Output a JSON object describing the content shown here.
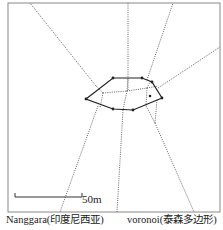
{
  "figure": {
    "frame": {
      "x": 8,
      "y": 3,
      "width": 212,
      "height": 209
    },
    "colors": {
      "frame": "#888888",
      "polygon": "#222222",
      "voronoi": "#555555",
      "background": "#ffffff"
    },
    "hull_polygon": [
      [
        86,
        99
      ],
      [
        113,
        78
      ],
      [
        142,
        78
      ],
      [
        152,
        82
      ],
      [
        162,
        98
      ],
      [
        133,
        110
      ],
      [
        113,
        109
      ]
    ],
    "vertices": [
      [
        86,
        99
      ],
      [
        113,
        78
      ],
      [
        142,
        78
      ],
      [
        152,
        82
      ],
      [
        162,
        98
      ],
      [
        133,
        110
      ],
      [
        113,
        109
      ]
    ],
    "interior_point": [
      150,
      96
    ],
    "voronoi_edges": [
      [
        [
          96,
          86
        ],
        [
          30,
          3
        ]
      ],
      [
        [
          128,
          90
        ],
        [
          128,
          3
        ]
      ],
      [
        [
          147,
          80
        ],
        [
          173,
          3
        ]
      ],
      [
        [
          158,
          88
        ],
        [
          220,
          47
        ]
      ],
      [
        [
          98,
          106
        ],
        [
          60,
          212
        ]
      ],
      [
        [
          123,
          110
        ],
        [
          117,
          212
        ]
      ],
      [
        [
          146,
          106
        ],
        [
          155,
          123
        ]
      ],
      [
        [
          157,
          100
        ],
        [
          155,
          123
        ]
      ],
      [
        [
          155,
          123
        ],
        [
          194,
          212
        ]
      ],
      [
        [
          103,
          93
        ],
        [
          127,
          91
        ]
      ],
      [
        [
          127,
          91
        ],
        [
          128,
          78
        ]
      ],
      [
        [
          127,
          91
        ],
        [
          123,
          110
        ]
      ],
      [
        [
          127,
          91
        ],
        [
          147,
          88
        ]
      ],
      [
        [
          103,
          93
        ],
        [
          100,
          108
        ]
      ],
      [
        [
          103,
          93
        ],
        [
          96,
          86
        ]
      ],
      [
        [
          147,
          88
        ],
        [
          151,
          80
        ]
      ],
      [
        [
          147,
          88
        ],
        [
          158,
          86
        ]
      ],
      [
        [
          147,
          88
        ],
        [
          146,
          106
        ]
      ]
    ],
    "scale_bar": {
      "x1": 15,
      "x2": 82,
      "y": 211,
      "tick_height": 4,
      "label": "50m"
    }
  },
  "captions": {
    "left": "Nanggara(印度尼西亚)",
    "right": "voronoi(泰森多边形)"
  }
}
